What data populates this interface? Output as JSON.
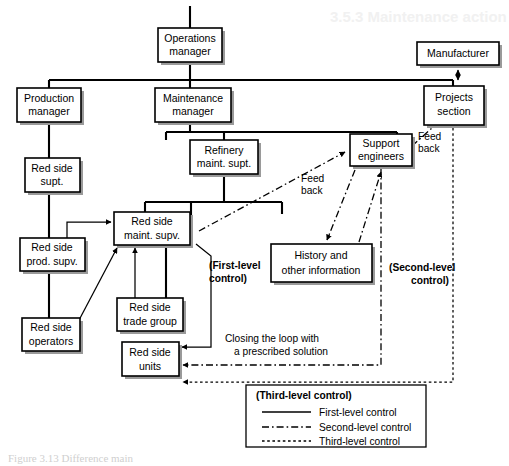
{
  "figure": {
    "type": "organizational-control-flow-diagram",
    "width": 509,
    "height": 466,
    "background_color": "#ffffff",
    "line_color": "#000000",
    "box_fill": "#ffffff",
    "shadow_color": "#9a9a9a"
  },
  "bleed_through_text": "3.5.3 Maintenance action",
  "caption_text": "Figure 3.13  Difference main",
  "nodes": {
    "operations_manager": {
      "label_line1": "Operations",
      "label_line2": "manager"
    },
    "manufacturer": {
      "label_line1": "Manufacturer",
      "label_line2": ""
    },
    "production_manager": {
      "label_line1": "Production",
      "label_line2": "manager"
    },
    "maintenance_manager": {
      "label_line1": "Maintenance",
      "label_line2": "manager"
    },
    "projects_section": {
      "label_line1": "Projects",
      "label_line2": "section"
    },
    "refinery_maint_supt": {
      "label_line1": "Refinery",
      "label_line2": "maint. supt."
    },
    "support_engineers": {
      "label_line1": "Support",
      "label_line2": "engineers"
    },
    "red_side_supt": {
      "label_line1": "Red side",
      "label_line2": "supt."
    },
    "red_side_maint_supv": {
      "label_line1": "Red side",
      "label_line2": "maint. supv."
    },
    "red_side_prod_supv": {
      "label_line1": "Red side",
      "label_line2": "prod. supv."
    },
    "history_info": {
      "label_line1": "History and",
      "label_line2": "other information"
    },
    "red_side_trade_group": {
      "label_line1": "Red side",
      "label_line2": "trade group"
    },
    "red_side_operators": {
      "label_line1": "Red side",
      "label_line2": "operators"
    },
    "red_side_units": {
      "label_line1": "Red side",
      "label_line2": "units"
    }
  },
  "annotations": {
    "feedback_upper": {
      "line1": "Feed",
      "line2": "back"
    },
    "feedback_lower": {
      "line1": "Feed",
      "line2": "back"
    },
    "first_level": {
      "line1": "(First-level",
      "line2": "control)"
    },
    "second_level": {
      "line1": "(Second-level",
      "line2": "control)"
    },
    "closing_loop": {
      "line1": "Closing the loop with",
      "line2": "a prescribed solution"
    }
  },
  "legend": {
    "title": "(Third-level control)",
    "items": [
      {
        "label": "First-level control",
        "style": "solid"
      },
      {
        "label": "Second-level control",
        "style": "dash-dot"
      },
      {
        "label": "Third-level control",
        "style": "dotted"
      }
    ]
  }
}
